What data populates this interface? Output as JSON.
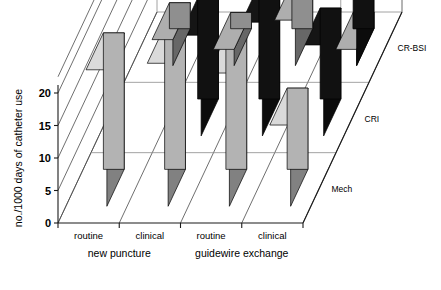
{
  "chart_data": {
    "type": "bar",
    "variant": "3d-grouped-bar",
    "title": "",
    "subtitle": "",
    "xlabel": "",
    "ylabel": "no./1000 days of catheter use",
    "zlabel": "",
    "ylim": [
      0,
      22.5
    ],
    "yticks": [
      0,
      5,
      10,
      15,
      20
    ],
    "ytick_labels": [
      "0",
      "5",
      "10",
      "15",
      "20"
    ],
    "grid": true,
    "legend_position": "right-depth-axis",
    "categories": [
      "routine",
      "clinical",
      "routine",
      "clinical"
    ],
    "category_groups": [
      {
        "label": "new puncture",
        "categories": [
          "routine",
          "clinical"
        ]
      },
      {
        "label": "guidewire exchange",
        "categories": [
          "routine",
          "clinical"
        ]
      }
    ],
    "depth_axis_labels": [
      "Mech",
      "CRI",
      "CR-BSI"
    ],
    "series": [
      {
        "name": "Mech",
        "row": 0,
        "color": "#b3b3b3",
        "values": [
          21.0,
          22.0,
          20.5,
          12.5
        ]
      },
      {
        "name": "CRI",
        "row": 1,
        "color": "#111111",
        "values": [
          0.0,
          15.5,
          17.5,
          14.0
        ]
      },
      {
        "name": "CR-BSI",
        "row": 2,
        "color": "#8f8f8f",
        "values": [
          4.0,
          2.5,
          7.0,
          2.5
        ]
      }
    ],
    "extra_bars": [
      {
        "series": "CR-BSI",
        "category_index": 3,
        "value": 11.5,
        "color": "#111111"
      }
    ],
    "colors": {
      "light_gray": "#b3b3b3",
      "mid_gray": "#8f8f8f",
      "black": "#111111",
      "grid": "#8c8c8c",
      "axis": "#1a1a1a",
      "background": "#ffffff"
    }
  },
  "axis": {
    "y_title": "no./1000 days of catheter use",
    "ticks": [
      "0",
      "5",
      "10",
      "15",
      "20"
    ]
  },
  "x_categories": [
    "routine",
    "clinical",
    "routine",
    "clinical"
  ],
  "x_groups": [
    "new puncture",
    "guidewire exchange"
  ],
  "depth_labels": [
    "Mech",
    "CRI",
    "CR-BSI"
  ]
}
